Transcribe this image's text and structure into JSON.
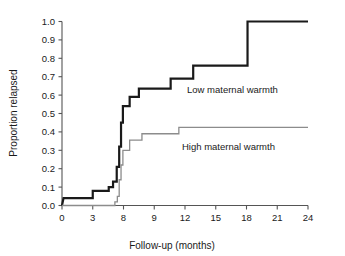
{
  "chart_data": {
    "type": "line",
    "subtype": "step-kaplan-meier",
    "title": "",
    "xlabel": "Follow-up (months)",
    "ylabel": "Proportion relapsed",
    "xlim": [
      0,
      24
    ],
    "ylim": [
      0,
      1.0
    ],
    "grid": false,
    "legend_position": "inline-annotation",
    "x_tick_labels": [
      "0",
      "3",
      "8",
      "9",
      "12",
      "15",
      "18",
      "21",
      "24"
    ],
    "x_tick_values": [
      0,
      3,
      8,
      9,
      12,
      15,
      18,
      21,
      24
    ],
    "y_tick_labels": [
      "0.0",
      "0.1",
      "0.2",
      "0.3",
      "0.4",
      "0.5",
      "0.6",
      "0.7",
      "0.8",
      "0.9",
      "1.0"
    ],
    "y_tick_values": [
      0.0,
      0.1,
      0.2,
      0.3,
      0.4,
      0.5,
      0.6,
      0.7,
      0.8,
      0.9,
      1.0
    ],
    "series": [
      {
        "name": "Low maternal warmth",
        "color": "#1a1a1a",
        "width": 2.2,
        "annotation": "Low maternal warmth",
        "points": [
          [
            0.0,
            0.0
          ],
          [
            0.15,
            0.04
          ],
          [
            3.0,
            0.04
          ],
          [
            3.0,
            0.08
          ],
          [
            5.6,
            0.08
          ],
          [
            5.6,
            0.1
          ],
          [
            6.3,
            0.1
          ],
          [
            6.3,
            0.13
          ],
          [
            6.9,
            0.13
          ],
          [
            6.9,
            0.21
          ],
          [
            7.3,
            0.21
          ],
          [
            7.3,
            0.32
          ],
          [
            7.6,
            0.32
          ],
          [
            7.6,
            0.45
          ],
          [
            7.9,
            0.45
          ],
          [
            7.9,
            0.54
          ],
          [
            8.2,
            0.54
          ],
          [
            8.2,
            0.59
          ],
          [
            8.5,
            0.59
          ],
          [
            8.5,
            0.635
          ],
          [
            10.6,
            0.635
          ],
          [
            10.6,
            0.69
          ],
          [
            12.8,
            0.69
          ],
          [
            12.8,
            0.76
          ],
          [
            18.1,
            0.76
          ],
          [
            18.1,
            1.0
          ],
          [
            24.0,
            1.0
          ]
        ]
      },
      {
        "name": "High maternal warmth",
        "color": "#8c8c8c",
        "width": 1.3,
        "annotation": "High maternal warmth",
        "points": [
          [
            0.0,
            0.0
          ],
          [
            6.6,
            0.0
          ],
          [
            6.6,
            0.02
          ],
          [
            7.0,
            0.02
          ],
          [
            7.0,
            0.05
          ],
          [
            7.3,
            0.05
          ],
          [
            7.3,
            0.14
          ],
          [
            7.6,
            0.14
          ],
          [
            7.6,
            0.22
          ],
          [
            7.9,
            0.22
          ],
          [
            7.9,
            0.3
          ],
          [
            8.2,
            0.3
          ],
          [
            8.2,
            0.355
          ],
          [
            8.6,
            0.355
          ],
          [
            8.6,
            0.39
          ],
          [
            11.4,
            0.39
          ],
          [
            11.4,
            0.425
          ],
          [
            24.0,
            0.425
          ]
        ]
      }
    ]
  },
  "annotations": {
    "low_label": "Low maternal warmth",
    "high_label": "High maternal warmth"
  },
  "colors": {
    "low_series": "#1a1a1a",
    "high_series": "#8c8c8c",
    "axis": "#555555",
    "text": "#1a1a1a"
  }
}
